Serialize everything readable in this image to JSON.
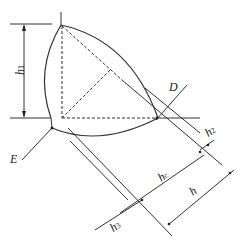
{
  "diagram": {
    "type": "geometric-technical-drawing",
    "stroke_color": "#333333",
    "labels": {
      "h1": {
        "main": "h",
        "sub": "1"
      },
      "D": "D",
      "E": "E",
      "h2": {
        "main": "h",
        "sub": "2"
      },
      "hc": {
        "main": "h",
        "sub": "c"
      },
      "h": "h",
      "h3": {
        "main": "h",
        "sub": "3"
      }
    }
  }
}
